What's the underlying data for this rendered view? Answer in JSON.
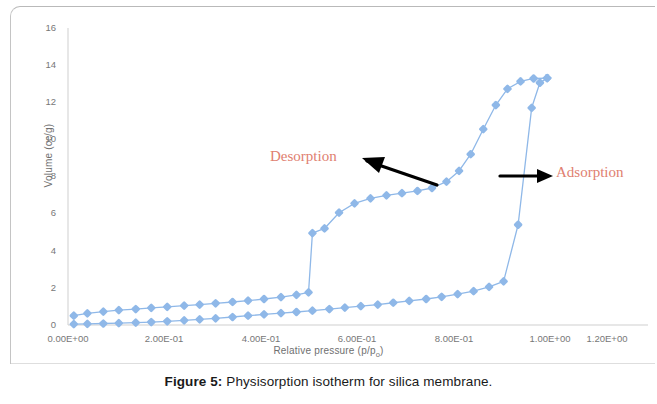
{
  "figure": {
    "caption_label": "Figure 5:",
    "caption_text": " Physisorption isotherm for silica membrane."
  },
  "annotations": {
    "desorption": "Desorption",
    "adsorption": "Adsorption",
    "arrow_color": "#000000",
    "text_color": "#e08070"
  },
  "axis": {
    "y_title": "Volume (cc/g)",
    "x_title_main": "Relative pressure (p/p",
    "x_title_sub": "o",
    "x_title_end": ")",
    "y_ticks": [
      "0",
      "2",
      "4",
      "6",
      "8",
      "10",
      "12",
      "14",
      "16"
    ],
    "x_ticks": [
      "0.00E+00",
      "2.00E-01",
      "4.00E-01",
      "6.00E-01",
      "8.00E-01",
      "1.00E+00",
      "1.20E+00"
    ]
  },
  "chart_data": {
    "type": "line",
    "title": "Physisorption isotherm for silica membrane",
    "xlabel": "Relative pressure (p/po)",
    "ylabel": "Volume (cc/g)",
    "xlim": [
      0,
      1.2
    ],
    "ylim": [
      0,
      16
    ],
    "xticks": [
      0,
      0.2,
      0.4,
      0.6,
      0.8,
      1.0,
      1.2
    ],
    "yticks": [
      0,
      2,
      4,
      6,
      8,
      10,
      12,
      14,
      16
    ],
    "grid": false,
    "legend": "none",
    "marker": "diamond",
    "line_color": "#8fb8e8",
    "marker_color": "#8fb8e8",
    "series": [
      {
        "name": "Adsorption",
        "points": [
          [
            0.012,
            0.05
          ],
          [
            0.04,
            0.06
          ],
          [
            0.073,
            0.08
          ],
          [
            0.105,
            0.1
          ],
          [
            0.14,
            0.13
          ],
          [
            0.172,
            0.16
          ],
          [
            0.205,
            0.2
          ],
          [
            0.24,
            0.25
          ],
          [
            0.272,
            0.3
          ],
          [
            0.305,
            0.36
          ],
          [
            0.34,
            0.43
          ],
          [
            0.372,
            0.5
          ],
          [
            0.405,
            0.57
          ],
          [
            0.44,
            0.64
          ],
          [
            0.472,
            0.7
          ],
          [
            0.505,
            0.77
          ],
          [
            0.54,
            0.86
          ],
          [
            0.572,
            0.94
          ],
          [
            0.605,
            1.02
          ],
          [
            0.64,
            1.1
          ],
          [
            0.672,
            1.2
          ],
          [
            0.705,
            1.3
          ],
          [
            0.74,
            1.4
          ],
          [
            0.772,
            1.52
          ],
          [
            0.805,
            1.66
          ],
          [
            0.838,
            1.82
          ],
          [
            0.87,
            2.05
          ],
          [
            0.9,
            2.35
          ],
          [
            0.93,
            5.4
          ],
          [
            0.958,
            11.7
          ],
          [
            0.975,
            13.05
          ],
          [
            0.99,
            13.3
          ]
        ]
      },
      {
        "name": "Desorption",
        "points": [
          [
            0.012,
            0.5
          ],
          [
            0.04,
            0.63
          ],
          [
            0.073,
            0.72
          ],
          [
            0.105,
            0.8
          ],
          [
            0.14,
            0.86
          ],
          [
            0.172,
            0.92
          ],
          [
            0.205,
            0.98
          ],
          [
            0.24,
            1.04
          ],
          [
            0.272,
            1.1
          ],
          [
            0.305,
            1.17
          ],
          [
            0.34,
            1.24
          ],
          [
            0.372,
            1.31
          ],
          [
            0.405,
            1.4
          ],
          [
            0.44,
            1.5
          ],
          [
            0.472,
            1.62
          ],
          [
            0.497,
            1.76
          ],
          [
            0.505,
            4.95
          ],
          [
            0.53,
            5.2
          ],
          [
            0.56,
            6.05
          ],
          [
            0.592,
            6.55
          ],
          [
            0.625,
            6.82
          ],
          [
            0.658,
            6.98
          ],
          [
            0.69,
            7.1
          ],
          [
            0.722,
            7.22
          ],
          [
            0.752,
            7.38
          ],
          [
            0.782,
            7.72
          ],
          [
            0.808,
            8.3
          ],
          [
            0.832,
            9.2
          ],
          [
            0.858,
            10.55
          ],
          [
            0.884,
            11.85
          ],
          [
            0.908,
            12.72
          ],
          [
            0.935,
            13.12
          ],
          [
            0.962,
            13.28
          ],
          [
            0.99,
            13.3
          ]
        ]
      }
    ],
    "annotations": [
      {
        "text": "Desorption",
        "x": 0.4,
        "y": 7.9,
        "arrow_to": [
          0.55,
          7.2
        ],
        "arrow_dir": "left"
      },
      {
        "text": "Adsorption",
        "x": 1.07,
        "y": 7.2,
        "arrow_to": [
          0.96,
          7.2
        ],
        "arrow_dir": "right"
      }
    ]
  }
}
